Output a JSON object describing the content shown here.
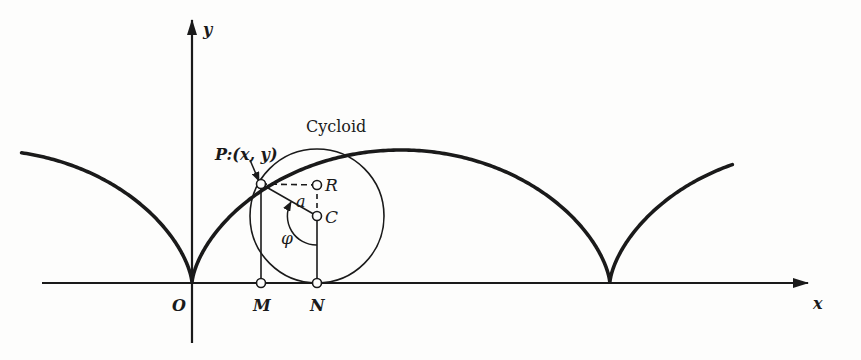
{
  "title": "Cycloid",
  "axes": {
    "x_label": "x",
    "y_label": "y",
    "origin_label": "O",
    "origin": [
      192,
      283
    ],
    "x_axis": {
      "from": 42,
      "to": 810
    },
    "y_axis": {
      "from": 20,
      "to": 343
    }
  },
  "curve": {
    "type": "cycloid",
    "radius_px": 66.5,
    "t_start": -2.85,
    "t_end": 8.75,
    "color": "#1a1a1a",
    "stroke_width": 3.6
  },
  "rolling_circle": {
    "center": [
      317,
      216
    ],
    "radius": 67
  },
  "points": {
    "P": {
      "label": "P:(x, y)",
      "pos": [
        261,
        184
      ]
    },
    "R": {
      "label": "R",
      "pos": [
        317,
        185
      ]
    },
    "C": {
      "label": "C",
      "pos": [
        317,
        216
      ]
    },
    "M": {
      "label": "M",
      "pos": [
        261,
        283
      ]
    },
    "N": {
      "label": "N",
      "pos": [
        317,
        283
      ]
    }
  },
  "annotations": {
    "radius_label": "a",
    "angle_label": "φ"
  }
}
